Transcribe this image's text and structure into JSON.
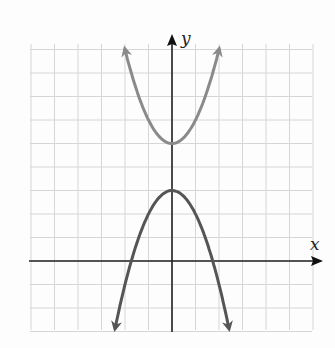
{
  "chart_data": {
    "type": "line",
    "title": "",
    "xlabel": "x",
    "ylabel": "y",
    "xlim": [
      -6,
      6
    ],
    "ylim": [
      -3,
      9
    ],
    "grid": true,
    "series": [
      {
        "name": "y = x^2 + 5",
        "equation": "y = x^2 + 5",
        "vertex": [
          0,
          5
        ],
        "opens": "up",
        "color": "#8a8a8a",
        "x": [
          -2,
          -1,
          0,
          1,
          2
        ],
        "values": [
          9,
          6,
          5,
          6,
          9
        ]
      },
      {
        "name": "y = 3 - x^2",
        "equation": "y = 3 - x^2",
        "vertex": [
          0,
          3
        ],
        "opens": "down",
        "color": "#555555",
        "x": [
          -2.4,
          -1.73,
          -1,
          0,
          1,
          1.73,
          2.4
        ],
        "values": [
          -2.76,
          0,
          2,
          3,
          2,
          0,
          -2.76
        ]
      }
    ]
  },
  "axes": {
    "x_label": "x",
    "y_label": "y"
  }
}
